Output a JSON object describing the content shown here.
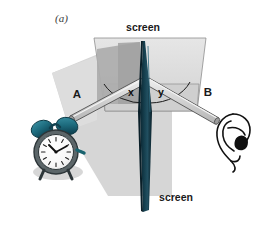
{
  "figure": {
    "panel_label": "(a)",
    "caption_absent": true,
    "labels": {
      "screen_top": "screen",
      "screen_bottom": "screen",
      "tube_a": "A",
      "tube_b": "B",
      "angle_incidence": "x",
      "angle_reflection": "y"
    },
    "colors": {
      "background": "#ffffff",
      "panel_face": "#dcdcdc",
      "panel_face_light": "#e4e4e4",
      "panel_shadow": "#a9a9a9",
      "floor_shadow": "#d3d3d3",
      "barrier_dark": "#10323f",
      "barrier_mid": "#1d4a5c",
      "barrier_edge": "#0a2029",
      "tube_fill": "#cfcfcf",
      "tube_highlight": "#ececec",
      "tube_outline": "#5a5a5a",
      "clock_bell": "#1f6f82",
      "clock_bell_dark": "#12505e",
      "clock_body": "#555f63",
      "clock_face": "#fbfbfb",
      "ink": "#1a1a1a",
      "label_gray": "#3a3a3a"
    },
    "elements": {
      "horizontal_screen": "trapezoidal screen panel seen in perspective",
      "vertical_screen": "narrow dark vertical reflecting screen",
      "tube_a_name": "incident sound tube A",
      "tube_b_name": "reflected sound tube B",
      "source": "alarm clock sound source",
      "detector": "human ear detector"
    }
  }
}
